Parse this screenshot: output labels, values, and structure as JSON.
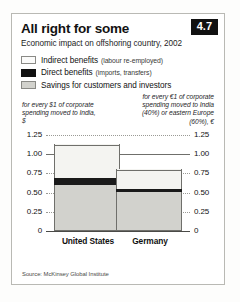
{
  "header": {
    "title": "All right for some",
    "subtitle": "Economic impact on offshoring country, 2002",
    "badge": "4.7"
  },
  "legend": {
    "items": [
      {
        "swatch": "indirect-swatch",
        "label": "Indirect benefits",
        "note": "(labour re-employed)",
        "color": "#fbfbfa"
      },
      {
        "swatch": "direct-swatch",
        "label": "Direct benefits",
        "note": "(imports, transfers)",
        "color": "#111111"
      },
      {
        "swatch": "savings-swatch",
        "label": "Savings for customers  and investors",
        "note": "",
        "color": "#d2d2cd"
      }
    ]
  },
  "annotations": {
    "left": "for every $1 of\ncorporate spending\nmoved to India, $",
    "right": "for every €1 of\ncorporate spending\nmoved to India (40%) or\neastern Europe (60%), €"
  },
  "axis": {
    "ticks": [
      "1.25",
      "1.00",
      "0.75",
      "0.50",
      "0.25",
      "0"
    ],
    "tick_values": [
      1.25,
      1.0,
      0.75,
      0.5,
      0.25,
      0
    ],
    "solid_tick": "1.00"
  },
  "source": "Source: McKinsey Global Institute",
  "chart_data": {
    "type": "bar",
    "title": "All right for some",
    "subtitle": "Economic impact on offshoring country, 2002",
    "xlabel": "",
    "ylabel": "",
    "ylim": [
      0,
      1.25
    ],
    "grid": true,
    "legend_position": "top-left",
    "stacked": true,
    "categories": [
      "United States",
      "Germany"
    ],
    "series": [
      {
        "name": "Savings for customers and investors",
        "values": [
          0.58,
          0.5
        ],
        "color": "#d2d2cd"
      },
      {
        "name": "Direct benefits (imports, transfers)",
        "values": [
          0.1,
          0.03
        ],
        "color": "#111111"
      },
      {
        "name": "Indirect benefits (labour re-employed)",
        "values": [
          0.44,
          0.27
        ],
        "color": "#f4f4f1"
      }
    ],
    "totals": [
      1.12,
      0.8
    ],
    "units": [
      "for every $1 of corporate spending moved to India, $",
      "for every €1 of corporate spending moved to India (40%) or eastern Europe (60%), €"
    ],
    "source": "Source: McKinsey Global Institute"
  }
}
